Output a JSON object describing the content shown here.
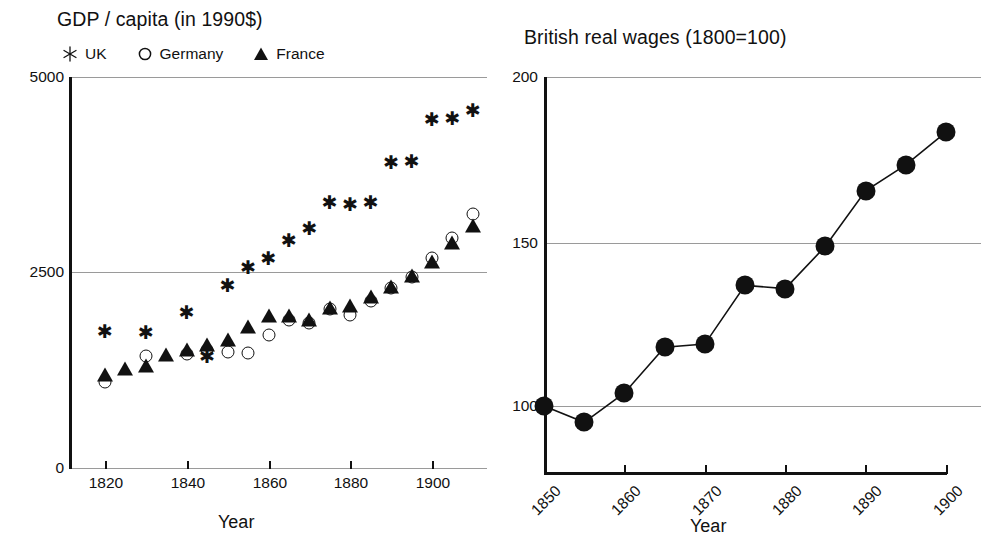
{
  "chart_data": [
    {
      "type": "scatter",
      "id": "gdp-per-capita",
      "title": "GDP / capita (in 1990$)",
      "xlabel": "Year",
      "ylabel": "",
      "xlim": [
        1811,
        1913
      ],
      "ylim": [
        0,
        5000
      ],
      "yticks": [
        0,
        2500,
        5000
      ],
      "xticks": [
        1820,
        1840,
        1860,
        1880,
        1900
      ],
      "grid": true,
      "legend_position": "top-left",
      "series": [
        {
          "name": "UK",
          "marker": "asterisk",
          "color": "#111111",
          "x": [
            1820,
            1830,
            1840,
            1845,
            1850,
            1855,
            1860,
            1865,
            1870,
            1875,
            1880,
            1885,
            1890,
            1895,
            1900,
            1905,
            1910
          ],
          "values": [
            1750,
            1740,
            2000,
            1430,
            2340,
            2570,
            2680,
            2910,
            3070,
            3400,
            3380,
            3400,
            3910,
            3930,
            4460,
            4480,
            4580
          ]
        },
        {
          "name": "Germany",
          "marker": "open-circle",
          "color": "#111111",
          "x": [
            1820,
            1830,
            1840,
            1845,
            1850,
            1855,
            1860,
            1865,
            1870,
            1875,
            1880,
            1885,
            1890,
            1895,
            1900,
            1905,
            1910
          ],
          "values": [
            1100,
            1430,
            1460,
            1510,
            1490,
            1470,
            1700,
            1890,
            1850,
            2040,
            1960,
            2140,
            2300,
            2440,
            2680,
            2940,
            3250
          ]
        },
        {
          "name": "France",
          "marker": "filled-triangle",
          "color": "#111111",
          "x": [
            1820,
            1825,
            1830,
            1835,
            1840,
            1845,
            1850,
            1855,
            1860,
            1865,
            1870,
            1875,
            1880,
            1885,
            1890,
            1895,
            1900,
            1905,
            1910
          ],
          "values": [
            1180,
            1260,
            1290,
            1430,
            1500,
            1560,
            1620,
            1790,
            1930,
            1930,
            1880,
            2040,
            2060,
            2180,
            2300,
            2440,
            2620,
            2870,
            3080
          ]
        }
      ]
    },
    {
      "type": "line",
      "id": "british-real-wages",
      "title": "British real wages (1800=100)",
      "xlabel": "Year",
      "ylabel": "",
      "xlim": [
        1850,
        1900
      ],
      "ylim": [
        80,
        200
      ],
      "yticks": [
        100,
        150,
        200
      ],
      "xticks": [
        1850,
        1860,
        1870,
        1880,
        1890,
        1900
      ],
      "xtick_rotation": -45,
      "grid": true,
      "marker": "filled-circle",
      "color": "#111111",
      "series": [
        {
          "name": "British real wages",
          "x": [
            1850,
            1855,
            1860,
            1865,
            1870,
            1875,
            1880,
            1885,
            1890,
            1895,
            1900
          ],
          "values": [
            100,
            95,
            104,
            118,
            119,
            137,
            136,
            149,
            166,
            174,
            184
          ]
        }
      ]
    }
  ],
  "left": {
    "title": "GDP / capita (in 1990$)",
    "xaxis_name": "Year",
    "legend": [
      {
        "label": "UK",
        "marker": "asterisk-icon"
      },
      {
        "label": "Germany",
        "marker": "open-circle-icon"
      },
      {
        "label": "France",
        "marker": "filled-triangle-icon"
      }
    ],
    "yticks": [
      "5000",
      "2500",
      "0"
    ],
    "xticks": [
      "1820",
      "1840",
      "1860",
      "1880",
      "1900"
    ]
  },
  "right": {
    "title": "British real wages (1800=100)",
    "xaxis_name": "Year",
    "yticks": [
      "200",
      "150",
      "100"
    ],
    "xticks": [
      "1850",
      "1860",
      "1870",
      "1880",
      "1890",
      "1900"
    ]
  },
  "style": {
    "ink": "#111111",
    "grid": "#9a9a9a",
    "background": "#ffffff"
  }
}
